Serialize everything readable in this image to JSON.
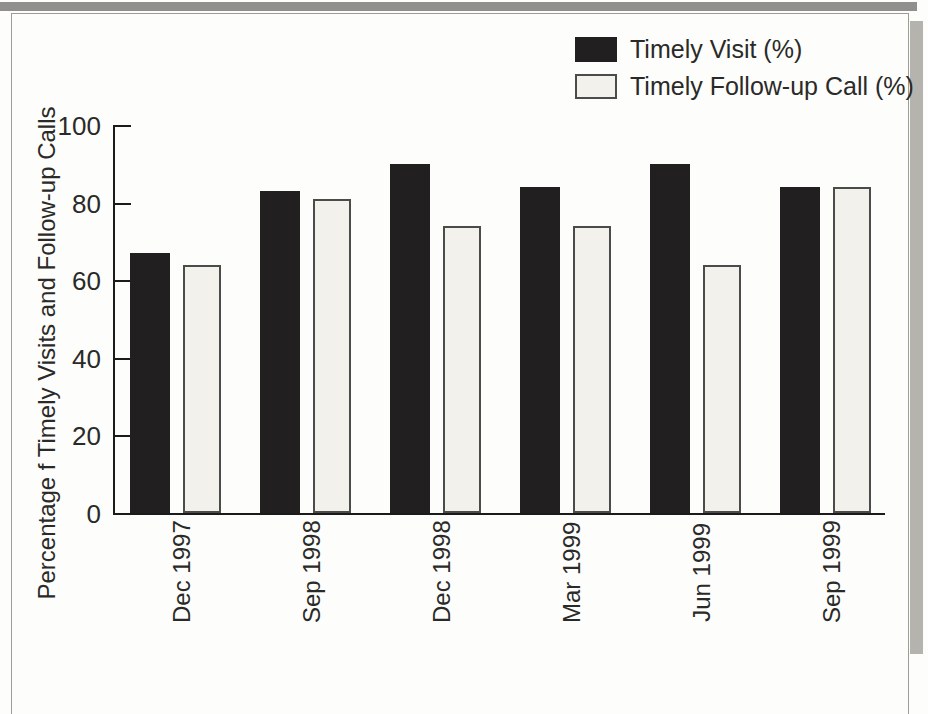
{
  "figure": {
    "kind": "scanned-book-figure",
    "background": "#fdfdfb",
    "frame_border_color": "#9c9c98",
    "scan_strip_top_color": "#908f8b",
    "scan_strip_right_color": "#b4b3ae"
  },
  "chart_data": {
    "type": "bar",
    "title": "",
    "xlabel": "",
    "ylabel": "Percentage f Timely Visits and Follow-up Calls",
    "categories": [
      "Dec 1997",
      "Sep 1998",
      "Dec 1998",
      "Mar 1999",
      "Jun 1999",
      "Sep 1999"
    ],
    "series": [
      {
        "name": "Timely Visit (%)",
        "color": "#211f20",
        "values": [
          67,
          83,
          90,
          84,
          90,
          84
        ]
      },
      {
        "name": "Timely Follow-up Call (%)",
        "color": "#f2f1ec",
        "border_color": "#4b4b49",
        "values": [
          64,
          81,
          74,
          74,
          64,
          84
        ]
      }
    ],
    "ylim": [
      0,
      100
    ],
    "yticks": [
      0,
      20,
      40,
      60,
      80,
      100
    ],
    "grid": false,
    "legend_position": "top-right",
    "axis_color": "#1b1b1b"
  }
}
